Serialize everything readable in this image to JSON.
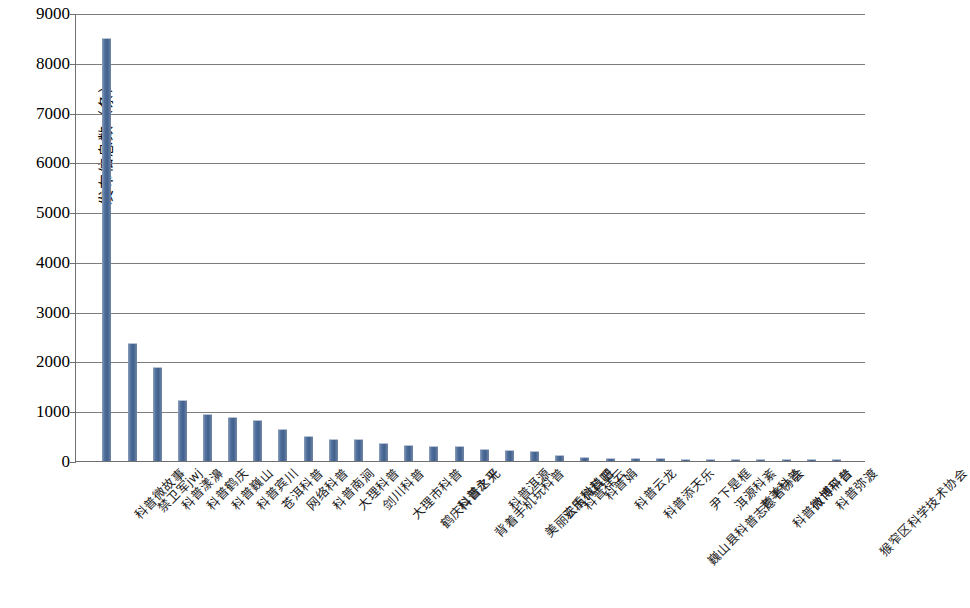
{
  "chart_data": {
    "type": "bar",
    "title": "",
    "xlabel": "",
    "ylabel": "发布信息数（条）",
    "ylim": [
      0,
      9000
    ],
    "ytick_step": 1000,
    "yticks": [
      "0",
      "1000",
      "2000",
      "3000",
      "4000",
      "5000",
      "6000",
      "7000",
      "8000",
      "9000"
    ],
    "grid": true,
    "legend": "none",
    "bar_color": "#4a6b96",
    "categories": [
      "科普微故事",
      "禁卫军jwj",
      "科普漾濞",
      "科普鹤庆",
      "科普巍山",
      "科普宾川",
      "苍洱科普",
      "网络科普",
      "科普南涧",
      "大理科普",
      "剑川科普",
      "大理市科普",
      "鹤庆科普之光",
      "科普永平",
      "背着手机玩科普",
      "科普洱源",
      "美丽云南微科普",
      "欢乐科普吧",
      "科普祥云",
      "科普娟",
      "科普云龙",
      "科普添天乐",
      "巍山县科普志愿者协会",
      "尹下是框",
      "洱源科紊",
      "老羊科普",
      "科普微博平台",
      "微博科普",
      "科普弥渡",
      "猴窄区科学技术协会"
    ],
    "values": [
      8480,
      2360,
      1870,
      1200,
      920,
      860,
      800,
      620,
      490,
      430,
      420,
      340,
      300,
      290,
      280,
      230,
      200,
      190,
      110,
      60,
      50,
      40,
      35,
      30,
      25,
      20,
      18,
      15,
      12,
      8
    ]
  }
}
